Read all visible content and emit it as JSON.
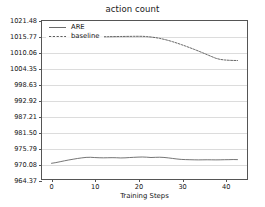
{
  "chart_data": {
    "type": "line",
    "title": "action count",
    "xlabel": "Training Steps",
    "ylabel": "",
    "xlim": [
      -2.2,
      45.2
    ],
    "ylim": [
      964.37,
      1021.48
    ],
    "xticks": [
      0,
      10,
      20,
      30,
      40
    ],
    "ytick_labels": [
      "1021.48",
      "1015.77",
      "1010.06",
      "1004.35",
      "998.63",
      "992.92",
      "987.21",
      "981.50",
      "975.79",
      "970.08",
      "964.37"
    ],
    "yticks": [
      1021.48,
      1015.77,
      1010.06,
      1004.35,
      998.63,
      992.92,
      987.21,
      981.5,
      975.79,
      970.08,
      964.37
    ],
    "grid": "horizontal",
    "legend_position": "upper left",
    "series": [
      {
        "name": "ARE",
        "style": "solid",
        "color": "#5a5a5a",
        "x": [
          0,
          1,
          2,
          3,
          4,
          5,
          6,
          7,
          8,
          9,
          10,
          11,
          12,
          13,
          14,
          15,
          16,
          17,
          18,
          19,
          20,
          21,
          22,
          23,
          24,
          25,
          26,
          27,
          28,
          29,
          30,
          31,
          32,
          33,
          34,
          35,
          36,
          37,
          38,
          39,
          40,
          41,
          42,
          43
        ],
        "y": [
          970.05,
          970.3,
          970.62,
          970.95,
          971.25,
          971.52,
          971.78,
          972.0,
          972.18,
          972.22,
          972.12,
          972.05,
          972.02,
          972.05,
          972.08,
          972.05,
          971.98,
          972.02,
          972.12,
          972.2,
          972.28,
          972.32,
          972.26,
          972.14,
          972.2,
          972.24,
          972.16,
          972.0,
          971.8,
          971.6,
          971.45,
          971.38,
          971.34,
          971.3,
          971.28,
          971.3,
          971.32,
          971.3,
          971.28,
          971.3,
          971.34,
          971.36,
          971.4,
          971.38
        ]
      },
      {
        "name": "baseline",
        "style": "dashed",
        "color": "#4a4a4a",
        "x": [
          0,
          1,
          2,
          3,
          4,
          5,
          6,
          7,
          8,
          9,
          10,
          11,
          12,
          13,
          14,
          15,
          16,
          17,
          18,
          19,
          20,
          21,
          22,
          23,
          24,
          25,
          26,
          27,
          28,
          29,
          30,
          31,
          32,
          33,
          34,
          35,
          36,
          37,
          38,
          39,
          40,
          41,
          42,
          43
        ],
        "y": [
          1015.55,
          1015.58,
          1015.6,
          1015.62,
          1015.64,
          1015.66,
          1015.68,
          1015.7,
          1015.72,
          1015.74,
          1015.76,
          1015.78,
          1015.8,
          1015.82,
          1015.84,
          1015.86,
          1015.88,
          1015.9,
          1015.92,
          1015.94,
          1015.95,
          1015.94,
          1015.85,
          1015.7,
          1015.48,
          1015.2,
          1014.86,
          1014.46,
          1014.0,
          1013.5,
          1012.96,
          1012.4,
          1011.82,
          1011.22,
          1010.6,
          1009.96,
          1009.3,
          1008.64,
          1008.0,
          1007.6,
          1007.4,
          1007.28,
          1007.22,
          1007.2
        ]
      }
    ]
  }
}
